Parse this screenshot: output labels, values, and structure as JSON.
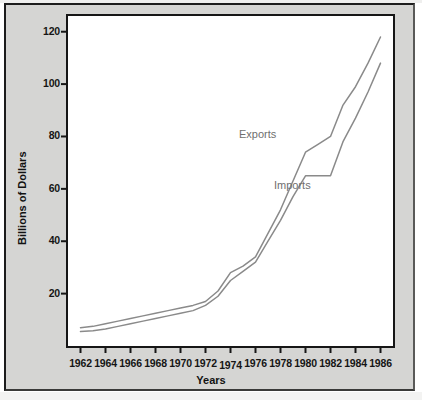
{
  "figure": {
    "background_color": "#d5d5d3",
    "plot_background_color": "#ffffff",
    "frame_color": "#161616",
    "line_color": "#8a8a8a",
    "label_color": "#6f6f6f"
  },
  "chart_data": {
    "type": "line",
    "title": "",
    "xlabel": "Years",
    "ylabel": "Billions of Dollars",
    "xlim": [
      1961,
      1987
    ],
    "ylim": [
      0,
      126
    ],
    "xticks": [
      1962,
      1964,
      1966,
      1968,
      1970,
      1972,
      1974,
      1976,
      1978,
      1980,
      1982,
      1984,
      1986
    ],
    "xtick_labels": [
      "1962",
      "1964",
      "1966",
      "1968",
      "1970",
      "1972",
      "1974",
      "1976",
      "1978",
      "1980",
      "1982",
      "1984",
      "1986"
    ],
    "yticks": [
      20,
      40,
      60,
      80,
      100,
      120
    ],
    "ytick_labels": [
      "20",
      "40",
      "60",
      "80",
      "100",
      "120"
    ],
    "grid": false,
    "legend_position": "inline-annotations",
    "x": [
      1962,
      1963,
      1964,
      1965,
      1966,
      1967,
      1968,
      1969,
      1970,
      1971,
      1972,
      1973,
      1974,
      1975,
      1976,
      1977,
      1978,
      1979,
      1980,
      1981,
      1982,
      1983,
      1984,
      1985,
      1986
    ],
    "series": [
      {
        "name": "Exports",
        "values": [
          7,
          7.5,
          8.5,
          9.5,
          10.5,
          11.5,
          12.5,
          13.5,
          14.5,
          15.5,
          17,
          21,
          28,
          30.5,
          34,
          43,
          52,
          63,
          74,
          77,
          80,
          92,
          99,
          108,
          118
        ]
      },
      {
        "name": "Imports",
        "values": [
          5.5,
          5.8,
          6.5,
          7.5,
          8.5,
          9.5,
          10.5,
          11.5,
          12.5,
          13.5,
          15.5,
          19,
          25,
          28.5,
          32,
          40,
          48,
          57,
          65,
          65,
          65,
          78,
          87,
          97,
          108
        ]
      }
    ],
    "annotations": [
      {
        "text": "Exports",
        "x": 1978.2,
        "y": 80.5
      },
      {
        "text": "Imports",
        "x": 1981.0,
        "y": 61.0
      }
    ]
  }
}
